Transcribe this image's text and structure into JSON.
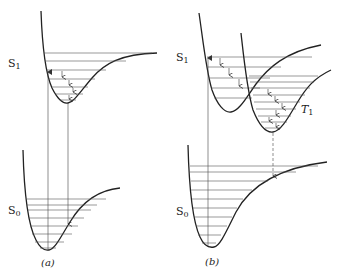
{
  "panels": [
    {
      "id": "a",
      "caption": "(a)",
      "labels": {
        "upper": "S",
        "upper_sub": "1",
        "lower": "S",
        "lower_sub": "0"
      }
    },
    {
      "id": "b",
      "caption": "(b)",
      "labels": {
        "upper": "S",
        "upper_sub": "1",
        "lower": "S",
        "lower_sub": "0",
        "triplet": "T",
        "triplet_sub": "1"
      }
    }
  ],
  "colors": {
    "line": "#222222",
    "thin": "#555555"
  }
}
